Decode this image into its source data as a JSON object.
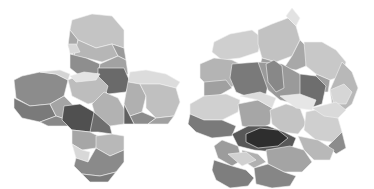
{
  "figure": {
    "width": 374,
    "height": 189,
    "background": "#ffffff",
    "panels": [
      {
        "id": "left-cluster",
        "description": "cross-shaped cluster of four polyhedral cages around a central cage",
        "facets": [
          {
            "p": "72,20 92,14 112,16 124,30 124,48 112,44 96,48 78,40 70,30",
            "c": "#c4c4c4"
          },
          {
            "p": "70,30 78,40 74,56 68,46",
            "c": "#a8a8a8"
          },
          {
            "p": "78,40 96,48 112,44 118,56 102,62 86,58 74,56",
            "c": "#b6b6b6"
          },
          {
            "p": "112,44 124,48 126,60 118,56",
            "c": "#9a9a9a"
          },
          {
            "p": "68,44 76,44 80,52 70,54",
            "c": "#d8d8d8"
          },
          {
            "p": "70,54 86,58 100,64 98,74 80,76 70,68",
            "c": "#8e8e8e"
          },
          {
            "p": "100,64 118,56 126,60 128,74 116,78 98,74",
            "c": "#a2a2a2"
          },
          {
            "p": "98,68 124,68 130,82 126,92 108,94 98,84",
            "c": "#6a6a6a"
          },
          {
            "p": "14,80 22,76 40,72 56,74 68,80 64,96 50,104 30,106 16,98",
            "c": "#8c8c8c"
          },
          {
            "p": "40,72 60,70 70,74 68,80 56,74",
            "c": "#d4d4d4"
          },
          {
            "p": "14,98 30,106 50,104 56,116 40,122 22,118 14,108",
            "c": "#7a7a7a"
          },
          {
            "p": "50,104 64,96 74,106 68,120 56,116",
            "c": "#a4a4a4"
          },
          {
            "p": "40,122 56,116 68,120 70,126 48,126",
            "c": "#888888"
          },
          {
            "p": "68,80 82,74 98,76 108,86 104,100 88,104 72,96",
            "c": "#bdbdbd"
          },
          {
            "p": "70,76 84,72 100,74 96,80 76,82",
            "c": "#e4e4e4"
          },
          {
            "p": "104,92 118,98 126,112 124,124 110,126 96,118 92,104",
            "c": "#b2b2b2"
          },
          {
            "p": "64,106 80,104 94,112 98,124 90,132 72,130 62,120",
            "c": "#505050"
          },
          {
            "p": "94,112 110,126 112,134 98,132 90,132",
            "c": "#6e6e6e"
          },
          {
            "p": "130,72 146,70 166,74 180,82 176,88 160,84 140,84 128,82",
            "c": "#dcdcdc"
          },
          {
            "p": "128,82 140,84 146,96 142,112 130,116 124,104",
            "c": "#b0b0b0"
          },
          {
            "p": "140,84 160,84 176,88 180,102 174,116 156,118 146,108 146,96",
            "c": "#c0c0c0"
          },
          {
            "p": "130,116 142,112 156,118 148,124 134,124",
            "c": "#8c8c8c"
          },
          {
            "p": "156,118 174,116 168,124 148,124",
            "c": "#a0a0a0"
          },
          {
            "p": "124,104 130,116 134,124 124,124",
            "c": "#606060"
          },
          {
            "p": "72,130 90,132 98,136 96,148 82,150 72,144",
            "c": "#a6a6a6"
          },
          {
            "p": "96,136 112,134 124,136 124,150 110,156 96,148",
            "c": "#b8b8b8"
          },
          {
            "p": "72,144 82,150 90,152 88,162 76,158",
            "c": "#d8d8d8"
          },
          {
            "p": "76,158 88,162 96,148 110,156 124,150 124,162 116,172 100,176 82,174 74,166",
            "c": "#8a8a8a"
          },
          {
            "p": "82,174 100,176 116,172 108,182 90,182",
            "c": "#7a7a7a"
          }
        ]
      },
      {
        "id": "right-cluster",
        "description": "larger interpenetrating cluster of polyhedral cages with dark central pore",
        "facets": [
          {
            "p": "214,42 230,34 252,30 262,38 258,52 240,58 222,60 212,52",
            "c": "#cfcfcf"
          },
          {
            "p": "258,30 272,24 288,18 296,26 300,40 292,56 276,62 262,58 258,44",
            "c": "#c2c2c2"
          },
          {
            "p": "286,16 292,8 300,18 296,26",
            "c": "#e2e2e2"
          },
          {
            "p": "262,58 276,62 280,74 270,80 258,72",
            "c": "#9e9e9e"
          },
          {
            "p": "292,56 300,40 308,48 306,66 296,70 284,68",
            "c": "#a8a8a8"
          },
          {
            "p": "304,42 322,42 336,50 346,62 342,76 330,80 316,74 306,66",
            "c": "#c8c8c8"
          },
          {
            "p": "316,74 330,80 328,92 316,92",
            "c": "#a0a0a0"
          },
          {
            "p": "342,62 352,72 358,88 352,104 342,112 332,104 330,90",
            "c": "#b8b8b8"
          },
          {
            "p": "330,90 344,84 352,92 346,104 334,104",
            "c": "#d6d6d6"
          },
          {
            "p": "200,64 214,58 232,60 244,66 240,82 226,90 210,88 200,78",
            "c": "#b4b4b4"
          },
          {
            "p": "204,82 226,80 232,88 218,96 204,96",
            "c": "#a0a0a0"
          },
          {
            "p": "232,64 258,62 270,76 266,94 250,98 236,92 230,78",
            "c": "#7a7a7a"
          },
          {
            "p": "258,62 282,64 300,74 306,96 296,104 280,100 268,90",
            "c": "#9a9a9a"
          },
          {
            "p": "266,64 274,60 282,66 284,88 276,92 268,82",
            "c": "#888888"
          },
          {
            "p": "300,74 316,76 326,86 322,104 310,108 300,100",
            "c": "#6e6e6e"
          },
          {
            "p": "190,104 204,96 226,94 240,100 238,112 222,120 204,120 190,114",
            "c": "#d0d0d0"
          },
          {
            "p": "190,114 204,120 222,120 236,126 232,136 212,138 196,132 188,124",
            "c": "#7a7a7a"
          },
          {
            "p": "238,104 258,100 272,108 270,124 258,130 242,126",
            "c": "#a6a6a6"
          },
          {
            "p": "240,96 260,92 276,98 272,108 258,100",
            "c": "#dcdcdc"
          },
          {
            "p": "270,110 286,104 300,108 306,124 298,134 282,132 272,124",
            "c": "#c4c4c4"
          },
          {
            "p": "280,96 300,94 316,100 312,110 296,108",
            "c": "#e6e6e6"
          },
          {
            "p": "306,112 324,108 338,118 342,132 332,142 316,140 304,130",
            "c": "#cfcfcf"
          },
          {
            "p": "312,108 336,102 346,110 338,118 324,116",
            "c": "#dadada"
          },
          {
            "p": "342,132 346,148 336,154 328,146",
            "c": "#8c8c8c"
          },
          {
            "p": "232,134 248,126 268,126 284,132 296,138 292,148 274,152 254,150 238,146",
            "c": "#585858"
          },
          {
            "p": "246,134 260,128 278,130 288,138 278,146 258,148 246,142",
            "c": "#2e2e2e"
          },
          {
            "p": "222,140 238,146 242,160 232,166 218,158 214,146",
            "c": "#9c9c9c"
          },
          {
            "p": "242,150 258,154 266,162 254,168 242,160",
            "c": "#b0b0b0"
          },
          {
            "p": "266,150 290,146 304,150 312,162 302,172 284,172 268,164",
            "c": "#a4a4a4"
          },
          {
            "p": "298,136 318,140 334,150 330,160 314,160 304,150",
            "c": "#b8b8b8"
          },
          {
            "p": "214,160 232,166 246,170 254,178 248,186 230,188 216,180 212,170",
            "c": "#7e7e7e"
          },
          {
            "p": "254,168 268,164 284,172 296,176 290,186 272,188 256,184",
            "c": "#868686"
          },
          {
            "p": "228,154 246,152 256,160 242,166",
            "c": "#d0d0d0"
          }
        ]
      }
    ]
  }
}
